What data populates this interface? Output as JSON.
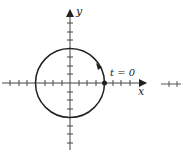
{
  "diagram": {
    "type": "parametric-circle",
    "axes": {
      "x_label": "x",
      "y_label": "y"
    },
    "circle": {
      "center": [
        0,
        0
      ],
      "radius": 1,
      "direction": "counterclockwise"
    },
    "start_point": {
      "label": "t = 0",
      "coords": [
        1,
        0
      ]
    },
    "ticks_per_unit": 4,
    "colors": {
      "stroke": "#222222",
      "background": "#ffffff"
    }
  }
}
